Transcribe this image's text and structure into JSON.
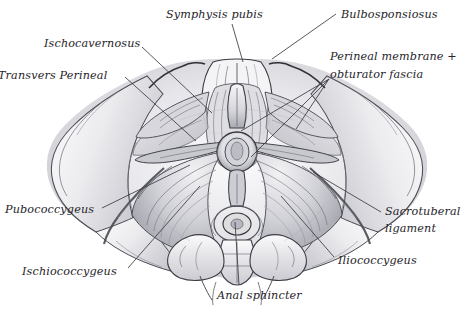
{
  "figure": {
    "style": "grayscale pencil and ink anatomical illustration",
    "background_color": "#ffffff",
    "ink_color": "#26242a",
    "shade_light": "#e8e8ea",
    "shade_mid": "#c3c3c8",
    "shade_dark": "#8a8a92",
    "leader_color": "#3a3a42"
  },
  "labels": [
    {
      "id": "symphysis-pubis",
      "text": "Symphysis pubis",
      "x": 166,
      "y": 8,
      "align": "left"
    },
    {
      "id": "bulbospongiosus",
      "text": "Bulbosponsiosus",
      "x": 341,
      "y": 8,
      "align": "left"
    },
    {
      "id": "ischiocavernosus",
      "text": "Ischocavernosus",
      "x": 44,
      "y": 37,
      "align": "left"
    },
    {
      "id": "perineal-membrane",
      "text": "Perineal membrane +",
      "x": 330,
      "y": 50,
      "align": "left"
    },
    {
      "id": "obturator-fascia",
      "text": "obturator fascia",
      "x": 330,
      "y": 68,
      "align": "left"
    },
    {
      "id": "transverse-perineal",
      "text": "Transvers Perineal",
      "x": -2,
      "y": 69,
      "align": "left"
    },
    {
      "id": "pubococcygeus",
      "text": "Pubococcygeus",
      "x": 5,
      "y": 203,
      "align": "left"
    },
    {
      "id": "sacrotuberal-ligament",
      "text": "Sacrotuberal",
      "x": 385,
      "y": 205,
      "align": "left"
    },
    {
      "id": "sacrotuberal-ligament-2",
      "text": "ligament",
      "x": 385,
      "y": 222,
      "align": "left"
    },
    {
      "id": "iliococcygeus",
      "text": "Iliococcygeus",
      "x": 338,
      "y": 254,
      "align": "left"
    },
    {
      "id": "ischiococcygeus",
      "text": "Ischiococcygeus",
      "x": 22,
      "y": 265,
      "align": "left"
    },
    {
      "id": "anal-sphincter",
      "text": "Anal sphincter",
      "x": 217,
      "y": 289,
      "align": "left"
    }
  ],
  "leaders": [
    {
      "id": "leader-symphysis-pubis",
      "x1": 232,
      "y1": 24,
      "x2": 243,
      "y2": 62
    },
    {
      "id": "leader-bulbospongiosus",
      "x1": 336,
      "y1": 14,
      "x2": 272,
      "y2": 59
    },
    {
      "id": "leader-ischiocavernosus",
      "x1": 142,
      "y1": 47,
      "x2": 212,
      "y2": 113
    },
    {
      "id": "leader-perineal-membrane-a",
      "x1": 329,
      "y1": 79,
      "x2": 241,
      "y2": 131
    },
    {
      "id": "leader-perineal-membrane-b",
      "x1": 329,
      "y1": 79,
      "x2": 251,
      "y2": 157
    },
    {
      "id": "leader-perineal-membrane-c",
      "x1": 329,
      "y1": 79,
      "x2": 296,
      "y2": 129
    },
    {
      "id": "leader-transverse-perineal",
      "x1": 125,
      "y1": 77,
      "x2": 196,
      "y2": 141
    },
    {
      "id": "leader-pubococcygeus",
      "x1": 102,
      "y1": 208,
      "x2": 190,
      "y2": 165
    },
    {
      "id": "leader-sacrotuberal",
      "x1": 381,
      "y1": 212,
      "x2": 313,
      "y2": 172
    },
    {
      "id": "leader-iliococcygeus",
      "x1": 334,
      "y1": 257,
      "x2": 281,
      "y2": 196
    },
    {
      "id": "leader-ischiococcygeus",
      "x1": 128,
      "y1": 268,
      "x2": 200,
      "y2": 186
    },
    {
      "id": "leader-anal-sphincter",
      "x1": 239,
      "y1": 285,
      "x2": 235,
      "y2": 222
    }
  ],
  "anatomy_parts": [
    {
      "id": "pelvic-outlet-outline",
      "name": "pelvic outlet bony rim"
    },
    {
      "id": "symphysis-pubis-bone",
      "name": "symphysis pubis"
    },
    {
      "id": "ischiopubic-ramus-left",
      "name": "left ischiopubic ramus"
    },
    {
      "id": "ischiopubic-ramus-right",
      "name": "right ischiopubic ramus"
    },
    {
      "id": "ischial-tuberosity-left",
      "name": "left ischial tuberosity"
    },
    {
      "id": "ischial-tuberosity-right",
      "name": "right ischial tuberosity"
    },
    {
      "id": "ischiocavernosus-left",
      "name": "left ischiocavernosus muscle"
    },
    {
      "id": "ischiocavernosus-right",
      "name": "right ischiocavernosus muscle"
    },
    {
      "id": "bulbospongiosus-muscle",
      "name": "bulbospongiosus muscle"
    },
    {
      "id": "transverse-perineal-left",
      "name": "left transverse perineal muscle"
    },
    {
      "id": "transverse-perineal-right",
      "name": "right transverse perineal muscle"
    },
    {
      "id": "perineal-membrane-left",
      "name": "left perineal membrane"
    },
    {
      "id": "perineal-membrane-right",
      "name": "right perineal membrane"
    },
    {
      "id": "levator-ani-left",
      "name": "left levator ani fan"
    },
    {
      "id": "levator-ani-right",
      "name": "right levator ani fan"
    },
    {
      "id": "anal-sphincter-ring",
      "name": "external anal sphincter"
    },
    {
      "id": "vaginal-opening",
      "name": "vaginal introitus"
    },
    {
      "id": "urethral-opening",
      "name": "urethral opening"
    },
    {
      "id": "perineal-body",
      "name": "perineal body"
    },
    {
      "id": "coccyx",
      "name": "coccyx"
    },
    {
      "id": "sacrum",
      "name": "sacrum"
    },
    {
      "id": "sacrotuberal-ligament-left",
      "name": "left sacrotuberal ligament"
    },
    {
      "id": "sacrotuberal-ligament-right",
      "name": "right sacrotuberal ligament"
    }
  ]
}
